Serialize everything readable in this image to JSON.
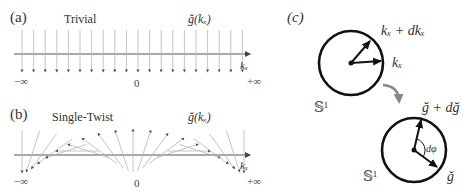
{
  "panel_a": {
    "tag": "(a)",
    "title": "Trivial",
    "field_label": "ğ(kₓ)",
    "axis_label": "kₓ",
    "ticks": {
      "left": "−∞",
      "center": "0",
      "right": "+∞"
    }
  },
  "panel_b": {
    "tag": "(b)",
    "title": "Single-Twist",
    "field_label": "ğ(kₓ)",
    "axis_label": "kₓ",
    "ticks": {
      "left": "−∞",
      "center": "0",
      "right": "+∞"
    }
  },
  "panel_c": {
    "tag": "(c)",
    "top_circle": {
      "label_arrow1": "kₓ + dkₓ",
      "label_arrow2": "kₓ",
      "space": "𝕊¹"
    },
    "bottom_circle": {
      "label_arrow1": "ğ + dğ",
      "label_arrow2": "ğ",
      "angle": "dφ",
      "space": "𝕊¹"
    }
  },
  "colors": {
    "arrow_light": "#b0b0b0",
    "arrow_head": "#555555",
    "axis": "#555555",
    "circle": "#111111",
    "map_arrow": "#888888"
  }
}
